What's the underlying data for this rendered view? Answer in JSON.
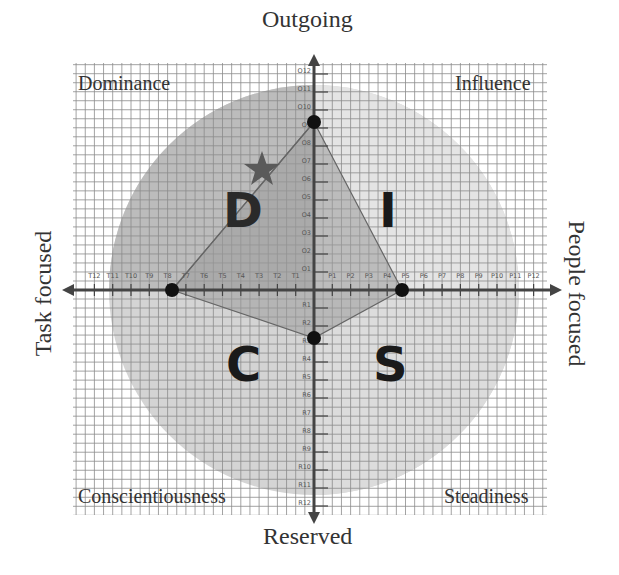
{
  "diagram": {
    "type": "DISC personality quadrant chart",
    "axes": {
      "top": "Outgoing",
      "bottom": "Reserved",
      "left": "Task focused",
      "right": "People focused"
    },
    "quadrants": {
      "top_left": "Dominance",
      "top_right": "Influence",
      "bottom_left": "Conscientiousness",
      "bottom_right": "Steadiness"
    },
    "letters": {
      "top_left": "D",
      "top_right": "I",
      "bottom_left": "C",
      "bottom_right": "S"
    },
    "tick_labels": {
      "outgoing": [
        "O1",
        "O2",
        "O3",
        "O4",
        "O5",
        "O6",
        "O7",
        "O8",
        "O9",
        "O10",
        "O11",
        "O12"
      ],
      "reserved": [
        "R1",
        "R2",
        "R3",
        "R4",
        "R5",
        "R6",
        "R7",
        "R8",
        "R9",
        "R10",
        "R11",
        "R12"
      ],
      "task": [
        "T1",
        "T2",
        "T3",
        "T4",
        "T5",
        "T6",
        "T7",
        "T8",
        "T9",
        "T10",
        "T11",
        "T12"
      ],
      "people": [
        "P1",
        "P2",
        "P3",
        "P4",
        "P5",
        "P6",
        "P7",
        "P8",
        "P9",
        "P10",
        "P11",
        "P12"
      ]
    },
    "profile_points": [
      {
        "label": "O9",
        "axis": "outgoing",
        "value": 9
      },
      {
        "label": "P5",
        "axis": "people",
        "value": 5
      },
      {
        "label": "R3",
        "axis": "reserved",
        "value": 3
      },
      {
        "label": "T7",
        "axis": "task",
        "value": 7
      }
    ],
    "marker": {
      "type": "star",
      "quadrant": "Dominance",
      "approx": {
        "x": -2.8,
        "y": 6.6
      }
    },
    "colors": {
      "grid": "#8a8a8a",
      "circle": "#c9c9c9",
      "light_quadrant": "#e2e2e2",
      "polygon": "#9e9e9e",
      "axis": "#444444",
      "point": "#111111",
      "star": "#5a5a5a"
    }
  }
}
